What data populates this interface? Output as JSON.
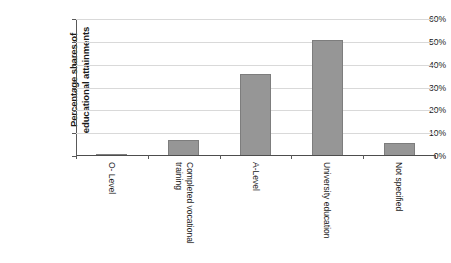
{
  "chart_data": {
    "type": "bar",
    "title": "",
    "xlabel": "",
    "ylabel": "Percentage shares of educational attainments",
    "ylabel_lines": [
      "Percentage shares of",
      "educational attainments"
    ],
    "categories": [
      "O- Level",
      "Completed vocational training",
      "A-Level",
      "University education",
      "Not specified"
    ],
    "category_lines": [
      [
        "O- Level"
      ],
      [
        "Completed vocational",
        "training"
      ],
      [
        "A-Level"
      ],
      [
        "University education"
      ],
      [
        "Not specified"
      ]
    ],
    "values": [
      1,
      7,
      36,
      51,
      5.5
    ],
    "value_labels": [
      "1%",
      "7%",
      "36%",
      "51%",
      "5.5%"
    ],
    "ylim": [
      0,
      60
    ],
    "ytick_values": [
      0,
      10,
      20,
      30,
      40,
      50,
      60
    ],
    "ytick_labels": [
      "0%",
      "10%",
      "20%",
      "30%",
      "40%",
      "50%",
      "60%"
    ],
    "grid": true,
    "grid_axis": "y",
    "legend": false,
    "legend_position": "none",
    "bar_color": "#969696",
    "bar_edge_color": "#7d7d7d",
    "gridline_color": "#d9d9d9",
    "axis_color": "#4d4d4d",
    "background_color": "#ffffff"
  }
}
